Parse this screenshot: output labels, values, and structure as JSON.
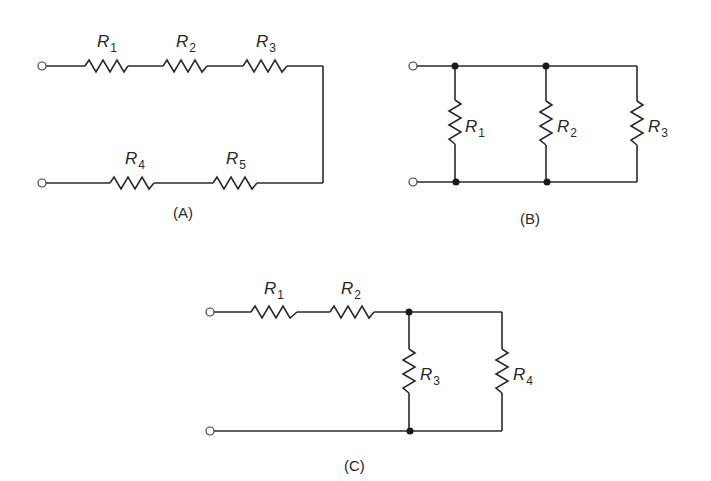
{
  "diagram": {
    "circuits": [
      {
        "id": "A",
        "caption": "(A)",
        "topology": "series",
        "resistors": [
          {
            "name": "R",
            "sub": "1"
          },
          {
            "name": "R",
            "sub": "2"
          },
          {
            "name": "R",
            "sub": "3"
          },
          {
            "name": "R",
            "sub": "4"
          },
          {
            "name": "R",
            "sub": "5"
          }
        ]
      },
      {
        "id": "B",
        "caption": "(B)",
        "topology": "parallel",
        "resistors": [
          {
            "name": "R",
            "sub": "1"
          },
          {
            "name": "R",
            "sub": "2"
          },
          {
            "name": "R",
            "sub": "3"
          }
        ]
      },
      {
        "id": "C",
        "caption": "(C)",
        "topology": "series-parallel",
        "resistors": [
          {
            "name": "R",
            "sub": "1"
          },
          {
            "name": "R",
            "sub": "2"
          },
          {
            "name": "R",
            "sub": "3"
          },
          {
            "name": "R",
            "sub": "4"
          }
        ]
      }
    ]
  }
}
